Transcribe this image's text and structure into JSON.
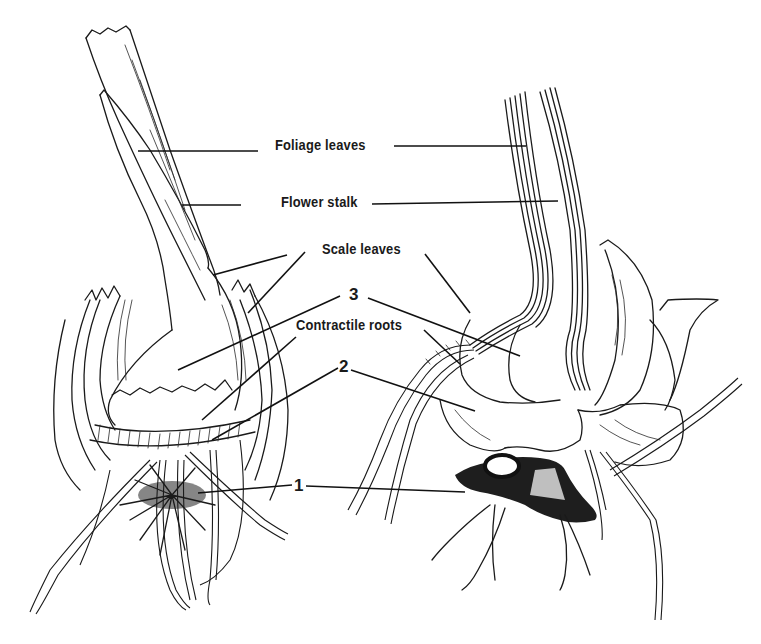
{
  "figure": {
    "labels": {
      "foliage_leaves": "Foliage leaves",
      "flower_stalk": "Flower stalk",
      "scale_leaves": "Scale leaves",
      "num_3": "3",
      "contractile_roots": "Contractile roots",
      "num_2": "2",
      "num_1": "1"
    },
    "drawings": [
      {
        "name": "left-bulb-drawing",
        "description": "Whole bulb with stalk, scale leaves, contractile roots and basal plate"
      },
      {
        "name": "right-bulb-section",
        "description": "Sectioned bulb showing new bulb, old corm and roots"
      }
    ],
    "colors": {
      "ink": "#1a1a1a",
      "background": "#ffffff"
    }
  }
}
